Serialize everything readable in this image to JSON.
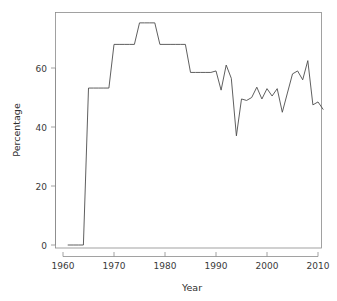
{
  "chart_data": {
    "type": "line",
    "title": "",
    "subtitle": "",
    "xlabel": "Year",
    "ylabel": "Percentage",
    "xlim": [
      1959,
      2012
    ],
    "ylim": [
      -1,
      78
    ],
    "grid": false,
    "legend": null,
    "xticks": [
      1960,
      1970,
      1980,
      1990,
      2000,
      2010
    ],
    "xtick_labels": [
      "1960",
      "1970",
      "1980",
      "1990",
      "2000",
      "2010"
    ],
    "yticks": [
      0,
      20,
      40,
      60
    ],
    "ytick_labels": [
      "0",
      "20",
      "40",
      "60"
    ],
    "series": [
      {
        "name": "Percentage",
        "color": "#4d4d4d",
        "x": [
          1961,
          1962,
          1963,
          1964,
          1965,
          1966,
          1967,
          1968,
          1969,
          1970,
          1971,
          1972,
          1973,
          1974,
          1975,
          1976,
          1977,
          1978,
          1979,
          1980,
          1981,
          1982,
          1983,
          1984,
          1985,
          1986,
          1987,
          1988,
          1989,
          1990,
          1991,
          1992,
          1993,
          1994,
          1995,
          1996,
          1997,
          1998,
          1999,
          2000,
          2001,
          2002,
          2003,
          2004,
          2005,
          2006,
          2007,
          2008,
          2009,
          2010,
          2011
        ],
        "values": [
          0,
          0,
          0,
          0,
          53.2,
          53.2,
          53.2,
          53.2,
          53.2,
          68.0,
          68.0,
          68.0,
          68.0,
          68.0,
          75.3,
          75.3,
          75.3,
          75.3,
          68.0,
          68.0,
          68.0,
          68.0,
          68.0,
          68.0,
          58.5,
          58.5,
          58.5,
          58.5,
          58.5,
          59.0,
          52.5,
          61.0,
          56.5,
          37.0,
          49.5,
          49.0,
          50.0,
          53.5,
          49.5,
          53.0,
          50.5,
          53.0,
          45.0,
          51.5,
          58.0,
          59.0,
          56.0,
          62.5,
          47.5,
          48.5,
          46.0
        ]
      }
    ]
  },
  "axes": {
    "x_title": "Year",
    "y_title": "Percentage"
  }
}
